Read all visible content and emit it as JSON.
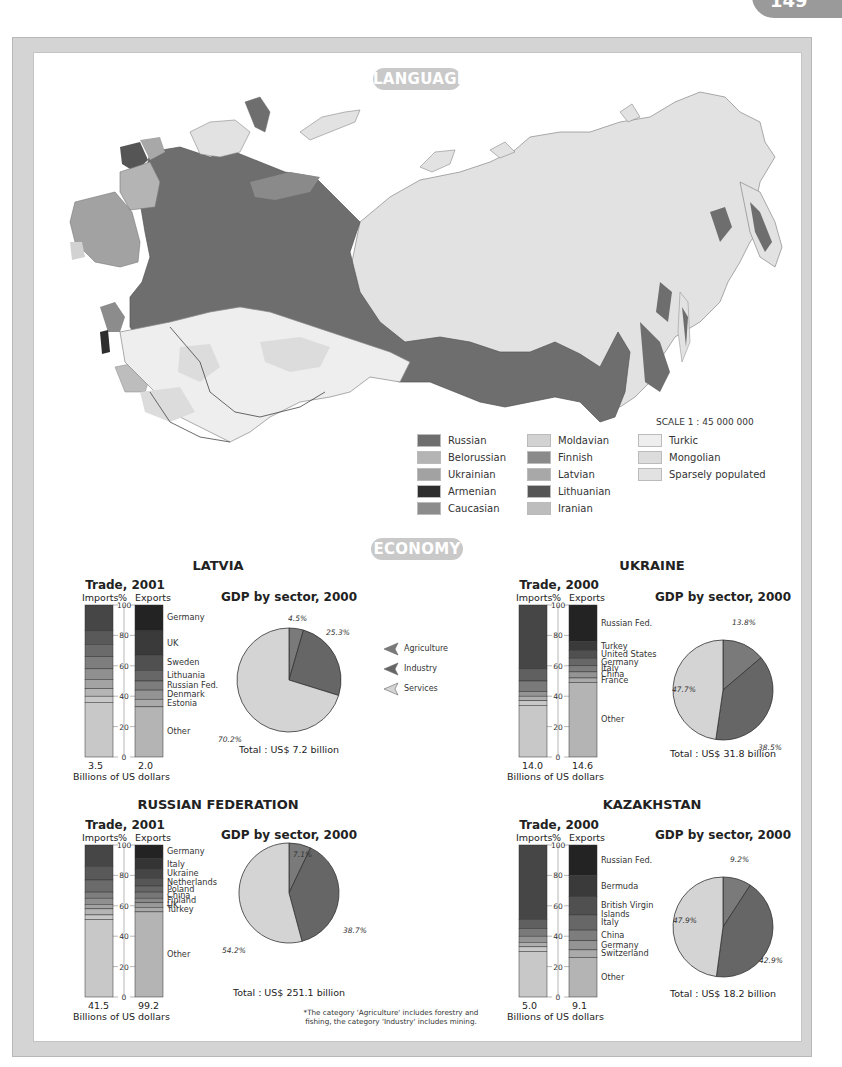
{
  "page": {
    "number": "149"
  },
  "language": {
    "heading": "LANGUAGE",
    "scale": "SCALE 1 : 45 000 000",
    "legend": [
      {
        "label": "Russian",
        "color": "#6e6e6e",
        "col": 0,
        "row": 0
      },
      {
        "label": "Belorussian",
        "color": "#b4b4b4",
        "col": 0,
        "row": 1
      },
      {
        "label": "Ukrainian",
        "color": "#a2a2a2",
        "col": 0,
        "row": 2
      },
      {
        "label": "Armenian",
        "color": "#2e2e2e",
        "col": 0,
        "row": 3
      },
      {
        "label": "Caucasian",
        "color": "#8c8c8c",
        "col": 0,
        "row": 4
      },
      {
        "label": "Moldavian",
        "color": "#d2d2d2",
        "col": 1,
        "row": 0
      },
      {
        "label": "Finnish",
        "color": "#8a8a8a",
        "col": 1,
        "row": 1
      },
      {
        "label": "Latvian",
        "color": "#a8a8a8",
        "col": 1,
        "row": 2
      },
      {
        "label": "Lithuanian",
        "color": "#555555",
        "col": 1,
        "row": 3
      },
      {
        "label": "Iranian",
        "color": "#bdbdbd",
        "col": 1,
        "row": 4
      },
      {
        "label": "Turkic",
        "color": "#eeeeee",
        "col": 2,
        "row": 0
      },
      {
        "label": "Mongolian",
        "color": "#dcdcdc",
        "col": 2,
        "row": 1
      },
      {
        "label": "Sparsely populated",
        "color": "#e2e2e2",
        "col": 2,
        "row": 2
      }
    ]
  },
  "economy": {
    "heading": "ECONOMY",
    "gdp_legend": [
      {
        "label": "Agriculture",
        "color": "#7a7a7a"
      },
      {
        "label": "Industry",
        "color": "#666666"
      },
      {
        "label": "Services",
        "color": "#d4d4d4"
      }
    ],
    "axis_ticks": [
      "100",
      "80",
      "60",
      "40",
      "20",
      "0"
    ],
    "axis_unit": "%",
    "imports_label": "Imports",
    "exports_label": "Exports",
    "units_label": "Billions of US dollars",
    "gdp_title": "GDP by sector, 2000",
    "footnote_line1": "*The category 'Agriculture' includes forestry and",
    "footnote_line2": "fishing, the category 'Industry' includes mining."
  },
  "chart_data": [
    {
      "type": "bar",
      "title": "LATVIA — Trade, 2001",
      "ylabel": "%",
      "ylim": [
        0,
        100
      ],
      "series": [
        {
          "name": "Imports",
          "total_label": "3.5",
          "stack": [
            {
              "label": "Germany",
              "value": 17
            },
            {
              "label": "Russian Fed.",
              "value": 9
            },
            {
              "label": "Lithuania",
              "value": 8
            },
            {
              "label": "Finland",
              "value": 8
            },
            {
              "label": "Sweden",
              "value": 7
            },
            {
              "label": "Estonia",
              "value": 6
            },
            {
              "label": "Poland",
              "value": 5
            },
            {
              "label": "Italy",
              "value": 4
            },
            {
              "label": "Other",
              "value": 36
            }
          ]
        },
        {
          "name": "Exports",
          "total_label": "2.0",
          "stack": [
            {
              "label": "Germany",
              "value": 17
            },
            {
              "label": "UK",
              "value": 16
            },
            {
              "label": "Sweden",
              "value": 10
            },
            {
              "label": "Lithuania",
              "value": 7
            },
            {
              "label": "Russian Fed.",
              "value": 6
            },
            {
              "label": "Denmark",
              "value": 6
            },
            {
              "label": "Estonia",
              "value": 5
            },
            {
              "label": "Other",
              "value": 33
            }
          ]
        }
      ],
      "xlabel": "Billions of US dollars"
    },
    {
      "type": "pie",
      "title": "LATVIA — GDP by sector, 2000",
      "categories": [
        "Agriculture",
        "Industry",
        "Services"
      ],
      "values": [
        4.5,
        25.3,
        70.2
      ],
      "labels": [
        "4.5%",
        "25.3%",
        "70.2%"
      ],
      "total": "Total : US$ 7.2 billion"
    },
    {
      "type": "bar",
      "title": "UKRAINE — Trade, 2000",
      "ylabel": "%",
      "ylim": [
        0,
        100
      ],
      "series": [
        {
          "name": "Imports",
          "total_label": "14.0",
          "stack": [
            {
              "label": "Russian Fed.",
              "value": 42
            },
            {
              "label": "Germany",
              "value": 8
            },
            {
              "label": "Turkmenistan",
              "value": 7
            },
            {
              "label": "Belarus",
              "value": 3
            },
            {
              "label": "France",
              "value": 3
            },
            {
              "label": "Kazakhstan",
              "value": 3
            },
            {
              "label": "Other",
              "value": 34
            }
          ]
        },
        {
          "name": "Exports",
          "total_label": "14.6",
          "stack": [
            {
              "label": "Russian Fed.",
              "value": 24
            },
            {
              "label": "Turkey",
              "value": 6
            },
            {
              "label": "United States",
              "value": 5
            },
            {
              "label": "Germany",
              "value": 5
            },
            {
              "label": "Italy",
              "value": 4
            },
            {
              "label": "China",
              "value": 4
            },
            {
              "label": "France",
              "value": 3
            },
            {
              "label": "Other",
              "value": 49
            }
          ]
        }
      ],
      "xlabel": "Billions of US dollars"
    },
    {
      "type": "pie",
      "title": "UKRAINE — GDP by sector, 2000",
      "categories": [
        "Agriculture",
        "Industry",
        "Services"
      ],
      "values": [
        13.8,
        38.5,
        47.7
      ],
      "labels": [
        "13.8%",
        "38.5%",
        "47.7%"
      ],
      "total": "Total : US$ 31.8 billion"
    },
    {
      "type": "bar",
      "title": "RUSSIAN FEDERATION — Trade, 2001",
      "ylabel": "%",
      "ylim": [
        0,
        100
      ],
      "series": [
        {
          "name": "Imports",
          "total_label": "41.5",
          "stack": [
            {
              "label": "Germany",
              "value": 14
            },
            {
              "label": "Ukraine",
              "value": 9
            },
            {
              "label": "United States",
              "value": 8
            },
            {
              "label": "Kazakhstan",
              "value": 4
            },
            {
              "label": "Italy",
              "value": 4
            },
            {
              "label": "China",
              "value": 3
            },
            {
              "label": "France",
              "value": 4
            },
            {
              "label": "Finland",
              "value": 3
            },
            {
              "label": "Other",
              "value": 51
            }
          ]
        },
        {
          "name": "Exports",
          "total_label": "99.2",
          "stack": [
            {
              "label": "Germany",
              "value": 9
            },
            {
              "label": "Italy",
              "value": 7
            },
            {
              "label": "Ukraine",
              "value": 6
            },
            {
              "label": "Netherlands",
              "value": 5
            },
            {
              "label": "Poland",
              "value": 4
            },
            {
              "label": "China",
              "value": 4
            },
            {
              "label": "Finland",
              "value": 3
            },
            {
              "label": "UK",
              "value": 3
            },
            {
              "label": "Turkey",
              "value": 3
            },
            {
              "label": "Other",
              "value": 56
            }
          ]
        }
      ],
      "xlabel": "Billions of US dollars"
    },
    {
      "type": "pie",
      "title": "RUSSIAN FEDERATION — GDP by sector, 2000",
      "categories": [
        "Agriculture",
        "Industry",
        "Services"
      ],
      "values": [
        7.1,
        38.7,
        54.2
      ],
      "labels": [
        "7.1%",
        "38.7%",
        "54.2%"
      ],
      "total": "Total : US$ 251.1 billion"
    },
    {
      "type": "bar",
      "title": "KAZAKHSTAN — Trade, 2000",
      "ylabel": "%",
      "ylim": [
        0,
        100
      ],
      "series": [
        {
          "name": "Imports",
          "total_label": "5.0",
          "stack": [
            {
              "label": "Russian Fed.",
              "value": 49
            },
            {
              "label": "Germany",
              "value": 6
            },
            {
              "label": "United States",
              "value": 5
            },
            {
              "label": "UK",
              "value": 4
            },
            {
              "label": "Italy",
              "value": 3
            },
            {
              "label": "China",
              "value": 3
            },
            {
              "label": "Other",
              "value": 30
            }
          ]
        },
        {
          "name": "Exports",
          "total_label": "9.1",
          "stack": [
            {
              "label": "Russian Fed.",
              "value": 20
            },
            {
              "label": "Bermuda",
              "value": 14
            },
            {
              "label": "British Virgin Islands",
              "value": 12
            },
            {
              "label": "Italy",
              "value": 10
            },
            {
              "label": "China",
              "value": 7
            },
            {
              "label": "Germany",
              "value": 6
            },
            {
              "label": "Switzerland",
              "value": 5
            },
            {
              "label": "Other",
              "value": 26
            }
          ]
        }
      ],
      "xlabel": "Billions of US dollars"
    },
    {
      "type": "pie",
      "title": "KAZAKHSTAN — GDP by sector, 2000",
      "categories": [
        "Agriculture",
        "Industry",
        "Services"
      ],
      "values": [
        9.2,
        42.9,
        47.9
      ],
      "labels": [
        "9.2%",
        "42.9%",
        "47.9%"
      ],
      "total": "Total : US$ 18.2 billion"
    }
  ],
  "countries": [
    {
      "name": "LATVIA",
      "trade_title": "Trade, 2001",
      "ox": 85,
      "oy": 605,
      "title_x": 218,
      "title_y": 558,
      "pie_cx": 289,
      "pie_cy": 680,
      "pie_r": 52,
      "gdp_chart": 1,
      "trade_chart": 0,
      "pie_label_pos": [
        [
          288,
          614
        ],
        [
          326,
          628
        ],
        [
          218,
          735
        ]
      ],
      "total_y": 744
    },
    {
      "name": "UKRAINE",
      "trade_title": "Trade, 2000",
      "ox": 519,
      "oy": 605,
      "title_x": 652,
      "title_y": 558,
      "pie_cx": 723,
      "pie_cy": 690,
      "pie_r": 50,
      "gdp_chart": 3,
      "trade_chart": 2,
      "pie_label_pos": [
        [
          732,
          618
        ],
        [
          758,
          743
        ],
        [
          672,
          685
        ]
      ],
      "total_y": 748
    },
    {
      "name": "RUSSIAN FEDERATION",
      "trade_title": "Trade, 2001",
      "ox": 85,
      "oy": 845,
      "title_x": 218,
      "title_y": 797,
      "pie_cx": 289,
      "pie_cy": 893,
      "pie_r": 50,
      "gdp_chart": 5,
      "trade_chart": 4,
      "pie_label_pos": [
        [
          293,
          850
        ],
        [
          343,
          926
        ],
        [
          222,
          946
        ]
      ],
      "total_y": 987
    },
    {
      "name": "KAZAKHSTAN",
      "trade_title": "Trade, 2000",
      "ox": 519,
      "oy": 845,
      "title_x": 652,
      "title_y": 797,
      "pie_cx": 723,
      "pie_cy": 927,
      "pie_r": 50,
      "gdp_chart": 7,
      "trade_chart": 6,
      "pie_label_pos": [
        [
          730,
          855
        ],
        [
          759,
          956
        ],
        [
          673,
          916
        ]
      ],
      "total_y": 988
    }
  ]
}
